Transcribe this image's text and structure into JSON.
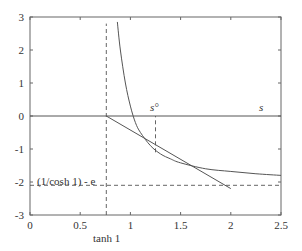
{
  "chart_data": {
    "type": "line",
    "title": "",
    "xlabel": "",
    "ylabel": "",
    "xlim": [
      0,
      2.5
    ],
    "ylim": [
      -3,
      3
    ],
    "grid": false,
    "x_ticks": [
      "0",
      "0.5",
      "1",
      "1.5",
      "2",
      "2.5"
    ],
    "y_ticks": [
      "3",
      "2",
      "1",
      "0",
      "-1",
      "-2",
      "-3"
    ],
    "series": [
      {
        "name": "curve",
        "style": "solid",
        "x": [
          0.87,
          0.9,
          0.95,
          1.0,
          1.05,
          1.1,
          1.2,
          1.3,
          1.4,
          1.5,
          1.75,
          2.0,
          2.25,
          2.5
        ],
        "y": [
          2.85,
          2.0,
          1.0,
          0.3,
          -0.2,
          -0.5,
          -0.9,
          -1.15,
          -1.3,
          -1.42,
          -1.6,
          -1.68,
          -1.75,
          -1.8
        ]
      },
      {
        "name": "tangent-line",
        "style": "solid",
        "x": [
          0.76,
          2.0
        ],
        "y": [
          0.0,
          -2.2
        ]
      },
      {
        "name": "s-axis",
        "style": "solid",
        "x": [
          0,
          2.5
        ],
        "y": [
          0,
          0
        ]
      }
    ],
    "reference_lines": [
      {
        "orientation": "vertical",
        "x": 0.76,
        "style": "dashed",
        "y_from": -3,
        "y_to": 2.8
      },
      {
        "orientation": "vertical",
        "x": 1.25,
        "style": "dashed",
        "y_from": -1.1,
        "y_to": 0
      },
      {
        "orientation": "horizontal",
        "y": -2.1,
        "style": "dashed",
        "x_from": 0,
        "x_to": 2.5
      }
    ],
    "annotations": [
      {
        "text": "s°",
        "x": 1.25,
        "y": 0.15,
        "italic": true
      },
      {
        "text": "s",
        "x": 2.3,
        "y": 0.15,
        "italic": true
      },
      {
        "text": "(1/cosh 1) - e",
        "x": 0.03,
        "y": -1.85,
        "italic": false
      },
      {
        "text": "tanh 1",
        "x": 0.76,
        "y": -3.45,
        "italic": false
      }
    ]
  },
  "labels": {
    "s_circ": "s°",
    "s": "s",
    "y_annotation": "(1/cosh 1) - e",
    "x_annotation": "tanh 1"
  }
}
